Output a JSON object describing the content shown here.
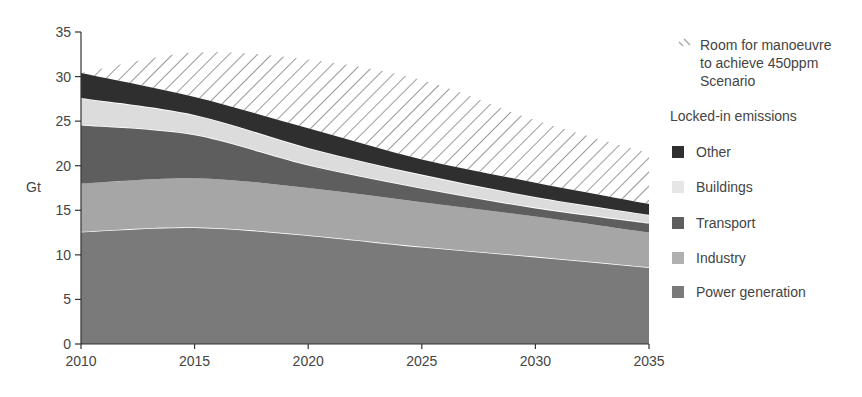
{
  "chart_data": {
    "type": "area",
    "stacked": true,
    "title": "",
    "xlabel": "",
    "ylabel": "Gt",
    "x": [
      2010,
      2015,
      2020,
      2025,
      2030,
      2035
    ],
    "xticks": [
      "2010",
      "2015",
      "2020",
      "2025",
      "2030",
      "2035"
    ],
    "yticks": [
      "0",
      "5",
      "10",
      "15",
      "20",
      "25",
      "30",
      "35"
    ],
    "ylim": [
      0,
      35
    ],
    "xlim": [
      2010,
      2035
    ],
    "grid": false,
    "legend_position": "right",
    "legend_group_title": "Locked-in emissions",
    "series": [
      {
        "name": "Power generation",
        "values": [
          12.6,
          13.1,
          12.2,
          10.9,
          9.8,
          8.6
        ],
        "color": "#7a7a7a"
      },
      {
        "name": "Industry",
        "values": [
          5.4,
          5.5,
          5.3,
          5.0,
          4.5,
          3.9
        ],
        "color": "#a6a6a6"
      },
      {
        "name": "Transport",
        "values": [
          6.6,
          4.9,
          2.6,
          1.6,
          1.0,
          1.1
        ],
        "color": "#5e5e5e"
      },
      {
        "name": "Buildings",
        "values": [
          3.0,
          2.2,
          1.9,
          1.5,
          1.2,
          0.9
        ],
        "color": "#dcdcdc"
      },
      {
        "name": "Other",
        "values": [
          2.8,
          2.0,
          2.2,
          1.7,
          1.6,
          1.2
        ],
        "color": "#2f2f2f"
      }
    ],
    "stack_tops": {
      "Power generation": [
        12.6,
        13.1,
        12.2,
        10.9,
        9.8,
        8.6
      ],
      "Industry": [
        18.0,
        18.6,
        17.5,
        15.9,
        14.3,
        12.5
      ],
      "Transport": [
        24.6,
        23.5,
        20.1,
        17.5,
        15.3,
        13.6
      ],
      "Buildings": [
        27.6,
        25.7,
        22.0,
        19.0,
        16.5,
        14.5
      ],
      "Other": [
        30.4,
        27.7,
        24.2,
        20.7,
        18.1,
        15.7
      ]
    },
    "hatch_region": {
      "name": "Room for manoeuvre to achieve 450ppm Scenario",
      "upper": [
        30.4,
        32.7,
        31.9,
        29.6,
        25.1,
        21.4
      ],
      "lower_is": "Other top"
    }
  },
  "legend": {
    "hatch_label": "Room for manoeuvre\nto achieve 450ppm\nScenario",
    "group_title": "Locked-in emissions",
    "items": [
      {
        "label": "Other",
        "color": "#2f2f2f"
      },
      {
        "label": "Buildings",
        "color": "#e6e6e6"
      },
      {
        "label": "Transport",
        "color": "#5e5e5e"
      },
      {
        "label": "Industry",
        "color": "#b0b0b0"
      },
      {
        "label": "Power generation",
        "color": "#7a7a7a"
      }
    ]
  },
  "axis": {
    "ylabel": "Gt"
  }
}
